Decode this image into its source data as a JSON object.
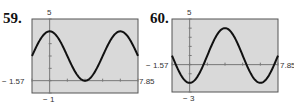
{
  "chart_data": [
    {
      "type": "line",
      "label": "59.",
      "xlim": [
        -1.57,
        7.85
      ],
      "ylim": [
        -1,
        5
      ],
      "tick_labels": {
        "ymax": "5",
        "ymin": "− 1",
        "xmin": "− 1.57",
        "xmax": "7.85"
      },
      "xticks_step": 1.57,
      "yticks_step": 1,
      "series": [
        {
          "name": "y = 2 + 2cos(x)",
          "function": "2+2*cos(x)",
          "x": [
            -1.57,
            0,
            1.57,
            3.14,
            4.71,
            6.28,
            7.85
          ],
          "y": [
            2,
            4,
            2,
            0,
            2,
            4,
            2
          ]
        }
      ],
      "grid": false
    },
    {
      "type": "line",
      "label": "60.",
      "xlim": [
        -1.57,
        7.85
      ],
      "ylim": [
        -3,
        5
      ],
      "tick_labels": {
        "ymax": "5",
        "ymin": "− 3",
        "xmin": "− 1.57",
        "xmax": "7.85"
      },
      "xticks_step": 1.57,
      "yticks_step": 1,
      "series": [
        {
          "name": "y = 1 − 3cos(x)",
          "function": "1-3*cos(x)",
          "x": [
            -1.57,
            0,
            1.57,
            3.14,
            4.71,
            6.28,
            7.85
          ],
          "y": [
            1,
            -2,
            1,
            4,
            1,
            -2,
            1
          ]
        }
      ],
      "grid": false
    }
  ],
  "colors": {
    "plot_bg": "#d9d9d9",
    "frame": "#555555",
    "curve": "#111111",
    "axis": "#777777"
  }
}
